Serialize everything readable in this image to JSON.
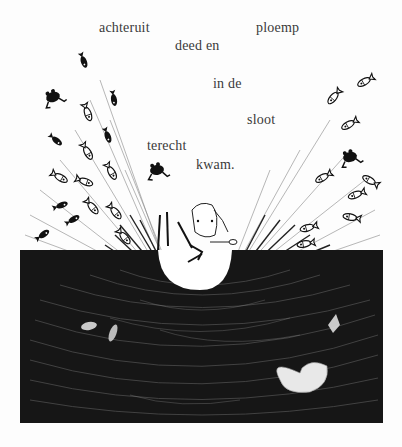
{
  "page": {
    "type": "picture-book-page",
    "background": "#fdfdfd",
    "ink_color": "#141414"
  },
  "text": {
    "words": [
      {
        "id": "achteruit",
        "label": "achteruit",
        "x": 99,
        "y": 21
      },
      {
        "id": "ploemp",
        "label": "ploemp",
        "x": 256,
        "y": 21
      },
      {
        "id": "deed-en",
        "label": "deed en",
        "x": 175,
        "y": 39
      },
      {
        "id": "in-de",
        "label": "in de",
        "x": 213,
        "y": 77
      },
      {
        "id": "sloot",
        "label": "sloot",
        "x": 247,
        "y": 113
      },
      {
        "id": "terecht",
        "label": "terecht",
        "x": 147,
        "y": 139
      },
      {
        "id": "kwam",
        "label": "kwam.",
        "x": 196,
        "y": 158
      }
    ]
  },
  "illustration": {
    "subject": "lamb-falling-backwards-into-ditch-splash",
    "elements": [
      "lamb",
      "splash-rays",
      "fish",
      "frogs",
      "ditch-water",
      "lily-pad"
    ],
    "fish_count_left": 14,
    "fish_count_right": 9,
    "frog_count": 3
  }
}
